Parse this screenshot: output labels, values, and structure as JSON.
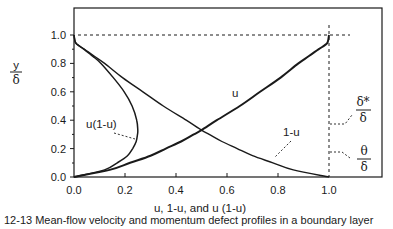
{
  "chart_data": {
    "type": "line",
    "title": "",
    "xlabel": "u, 1-u, and  u (1-u)",
    "ylabel_num": "y",
    "ylabel_den": "δ",
    "xlim": [
      0.0,
      1.0
    ],
    "ylim": [
      0.0,
      1.0
    ],
    "xticks": [
      "0.0",
      "0.2",
      "0.4",
      "0.6",
      "0.8",
      "1.0"
    ],
    "yticks": [
      "0.0",
      "0.2",
      "0.4",
      "0.6",
      "0.8",
      "1.0"
    ],
    "grid": false,
    "legend": "none (inline curve labels)",
    "series": [
      {
        "name": "u",
        "label": "u",
        "style": "thick solid",
        "y": [
          0.0,
          0.05,
          0.1,
          0.15,
          0.2,
          0.25,
          0.3,
          0.33,
          0.4,
          0.5,
          0.6,
          0.7,
          0.8,
          0.85,
          0.9,
          0.93,
          0.95,
          1.0
        ],
        "x": [
          0.0,
          0.14,
          0.22,
          0.3,
          0.36,
          0.42,
          0.47,
          0.5,
          0.56,
          0.65,
          0.73,
          0.81,
          0.88,
          0.92,
          0.96,
          0.985,
          0.995,
          1.0
        ]
      },
      {
        "name": "1-u",
        "label": "1-u",
        "style": "solid",
        "y": [
          0.0,
          0.05,
          0.1,
          0.15,
          0.2,
          0.25,
          0.3,
          0.33,
          0.4,
          0.5,
          0.6,
          0.7,
          0.8,
          0.85,
          0.9,
          0.93,
          0.95,
          1.0
        ],
        "x": [
          1.0,
          0.86,
          0.78,
          0.7,
          0.64,
          0.58,
          0.53,
          0.5,
          0.44,
          0.35,
          0.27,
          0.19,
          0.12,
          0.08,
          0.04,
          0.015,
          0.005,
          0.0
        ]
      },
      {
        "name": "u(1-u)",
        "label": "u(1-u)",
        "style": "solid",
        "y": [
          0.0,
          0.05,
          0.1,
          0.15,
          0.2,
          0.25,
          0.3,
          0.33,
          0.4,
          0.5,
          0.6,
          0.7,
          0.8,
          0.85,
          0.9,
          0.93,
          0.95,
          1.0
        ],
        "x": [
          0.0,
          0.12,
          0.17,
          0.21,
          0.23,
          0.244,
          0.249,
          0.25,
          0.246,
          0.228,
          0.197,
          0.154,
          0.106,
          0.074,
          0.038,
          0.015,
          0.005,
          0.0
        ]
      }
    ],
    "annotations": [
      {
        "text": "u",
        "near": "u curve at x≈0.62, y≈0.6"
      },
      {
        "text": "1-u",
        "near": "1-u curve, leader to x≈0.78, y≈0.22"
      },
      {
        "text": "u(1-u)",
        "near": "u(1-u) curve, leader to x≈0.24, y≈0.26"
      },
      {
        "text": "δ*/δ",
        "meaning": "area to the left of 1-u (displacement thickness)",
        "y": 0.34
      },
      {
        "text": "θ/δ",
        "meaning": "area under u(1-u) (momentum thickness)",
        "y": 0.12
      },
      {
        "text": "dashed reference lines",
        "meaning": "y/δ = 1.0 horizontal, u = 1.0 vertical"
      }
    ]
  },
  "labels": {
    "ylabel_num": "y",
    "ylabel_den": "δ",
    "xlabel": "u, 1-u, and  u (1-u)",
    "u": "u",
    "one_minus_u": "1-u",
    "u_one_minus_u": "u(1-u)",
    "delta_star_num": "δ*",
    "delta_star_den": "δ",
    "theta_num": "θ",
    "theta_den": "δ",
    "caption": "12-13  Mean-flow velocity and momentum defect profiles in a boundary layer"
  }
}
